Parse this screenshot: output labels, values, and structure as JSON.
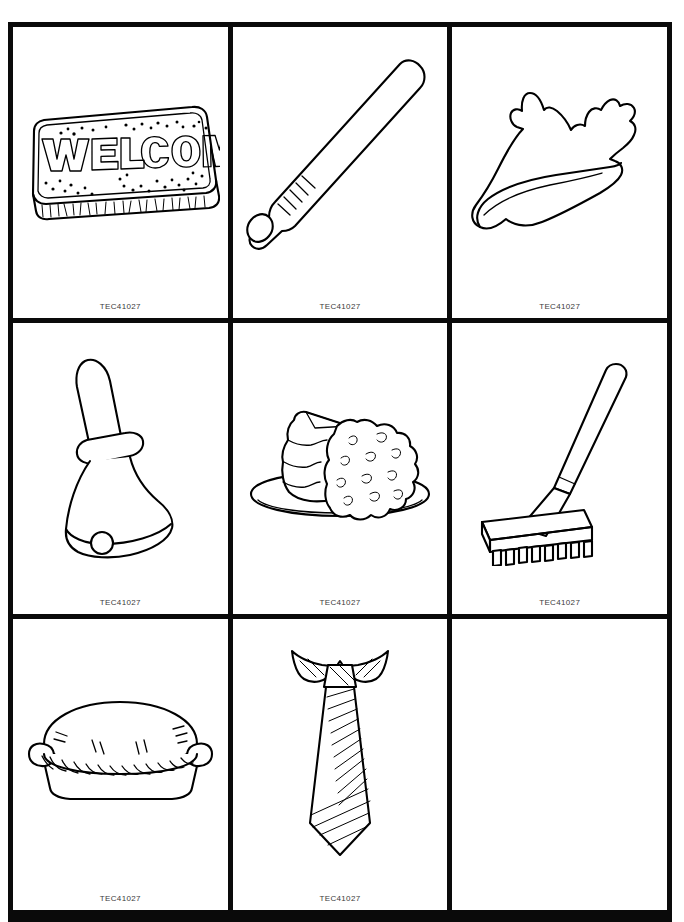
{
  "page": {
    "header_faint_text": "",
    "background_color": "#ffffff",
    "border_color": "#0a0a0a",
    "caption_color": "#3b3b3b",
    "columns": 3,
    "rows": 3
  },
  "cells": [
    {
      "index": 1,
      "icon": "welcome-mat-icon",
      "subject": "welcome mat",
      "art_text": "WELCOME",
      "caption": "TEC41027",
      "empty": false
    },
    {
      "index": 2,
      "icon": "baseball-bat-icon",
      "subject": "baseball bat",
      "art_text": "",
      "caption": "TEC41027",
      "empty": false
    },
    {
      "index": 3,
      "icon": "conch-shell-icon",
      "subject": "conch shell",
      "art_text": "",
      "caption": "TEC41027",
      "empty": false
    },
    {
      "index": 4,
      "icon": "hand-bell-icon",
      "subject": "hand bell",
      "art_text": "",
      "caption": "TEC41027",
      "empty": false
    },
    {
      "index": 5,
      "icon": "layer-cake-icon",
      "subject": "layer cake on plate",
      "art_text": "",
      "caption": "TEC41027",
      "empty": false
    },
    {
      "index": 6,
      "icon": "garden-rake-icon",
      "subject": "garden rake",
      "art_text": "",
      "caption": "TEC41027",
      "empty": false
    },
    {
      "index": 7,
      "icon": "pie-icon",
      "subject": "pie with braided crust",
      "art_text": "",
      "caption": "TEC41027",
      "empty": false
    },
    {
      "index": 8,
      "icon": "necktie-icon",
      "subject": "striped necktie with collar",
      "art_text": "",
      "caption": "TEC41027",
      "empty": false
    },
    {
      "index": 9,
      "icon": "",
      "subject": "",
      "art_text": "",
      "caption": "",
      "empty": true
    }
  ]
}
